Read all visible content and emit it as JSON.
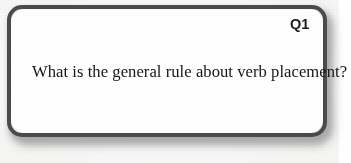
{
  "card": {
    "number_label": "Q1",
    "question_text": "What is the general rule about verb placement?",
    "border_color": "#4b4b4b",
    "background_color": "#ffffff",
    "text_color": "#161616",
    "number_color": "#1d1d1d",
    "page_background_color": "#fefefe",
    "shadow_color": "#8e8e8e"
  }
}
